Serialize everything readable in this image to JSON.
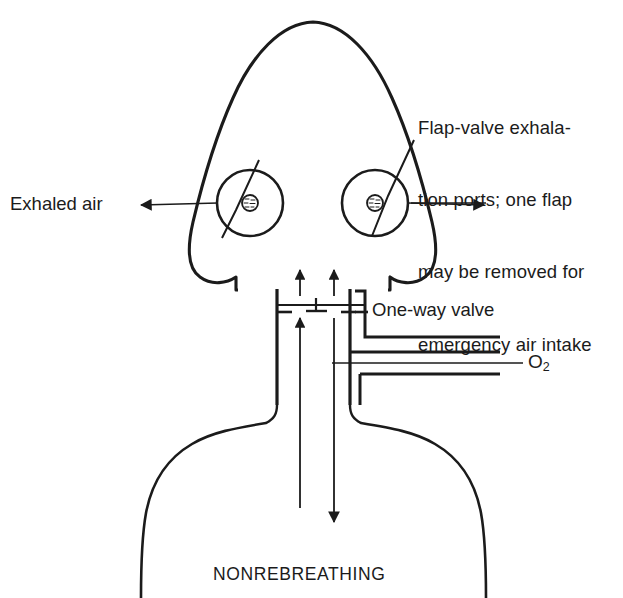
{
  "figure": {
    "caption": "NONREBREATHING",
    "stroke_color": "#1b1b1b",
    "background_color": "#ffffff",
    "callouts": {
      "flap_valve": {
        "line1": "Flap-valve exhala-",
        "line2": "tion ports; one flap",
        "line3": "may be removed for",
        "line4": "emergency air intake"
      },
      "exhaled_air": "Exhaled air",
      "one_way_valve": "One-way valve",
      "oxygen_symbol": "O",
      "oxygen_subscript": "2"
    }
  }
}
